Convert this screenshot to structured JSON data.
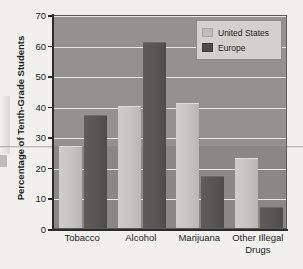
{
  "chart_data": {
    "type": "bar",
    "title": "",
    "subtitle": "",
    "xlabel": "",
    "ylabel": "Percentage of Tenth-Grade Students",
    "categories": [
      "Tobacco",
      "Alcohol",
      "Marijuana",
      "Other Illegal\nDrugs"
    ],
    "category_labels": [
      {
        "line1": "Tobacco",
        "line2": ""
      },
      {
        "line1": "Alcohol",
        "line2": ""
      },
      {
        "line1": "Marijuana",
        "line2": ""
      },
      {
        "line1": "Other Illegal",
        "line2": "Drugs"
      }
    ],
    "series": [
      {
        "name": "United States",
        "color": "#c6c4c0",
        "values": [
          27,
          40,
          41,
          23
        ]
      },
      {
        "name": "Europe",
        "color": "#55534f",
        "values": [
          37,
          61,
          17,
          7
        ]
      }
    ],
    "ylim": [
      0,
      70
    ],
    "ytick_step": 10,
    "yticks": [
      0,
      10,
      20,
      30,
      40,
      50,
      60,
      70
    ],
    "ytick_labels": [
      "0",
      "10",
      "20",
      "30",
      "40",
      "50",
      "60",
      "70"
    ],
    "grid": true,
    "grid_axis": "y",
    "legend_position": "top-right",
    "plot_background": "#8f8d8b",
    "gridline_color": "#e9e7e4",
    "axis_color": "#2b2b2b"
  },
  "legend": {
    "items": [
      {
        "label": "United States",
        "swatch": "us"
      },
      {
        "label": "Europe",
        "swatch": "eu"
      }
    ]
  }
}
